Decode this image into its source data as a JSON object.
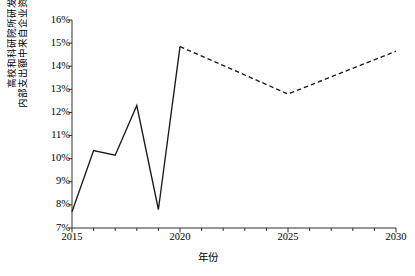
{
  "chart_data": {
    "type": "line",
    "title": "",
    "xlabel": "年份",
    "ylabel_lines": [
      "高校和科研院所研发经费",
      "内部支出额中来自企业资金的比例"
    ],
    "ylabel": "高校和科研院所研发经费内部支出额中来自企业资金的比例",
    "x": [
      2015,
      2016,
      2017,
      2018,
      2019,
      2020,
      2025,
      2030
    ],
    "xlim": [
      2015,
      2030
    ],
    "ylim": [
      7,
      16
    ],
    "y_unit": "%",
    "grid": false,
    "legend": false,
    "xticks": [
      2015,
      2020,
      2025,
      2030
    ],
    "xtick_labels": [
      "2015",
      "2020",
      "2025",
      "2030"
    ],
    "xminor_tick_interval": 1,
    "yticks": [
      7,
      8,
      9,
      10,
      11,
      12,
      13,
      14,
      15,
      16
    ],
    "ytick_labels": [
      "7%",
      "8%",
      "9%",
      "10%",
      "11%",
      "12%",
      "13%",
      "14%",
      "15%",
      "16%"
    ],
    "line_color": "#1a1a1a",
    "series": [
      {
        "name": "历史值",
        "style": "solid",
        "x": [
          2015,
          2016,
          2017,
          2018,
          2019,
          2020
        ],
        "values": [
          7.7,
          10.35,
          10.15,
          12.3,
          7.8,
          14.85
        ]
      },
      {
        "name": "预测值",
        "style": "dashed",
        "x": [
          2020,
          2025,
          2030
        ],
        "values": [
          14.85,
          12.8,
          14.65
        ]
      }
    ]
  }
}
